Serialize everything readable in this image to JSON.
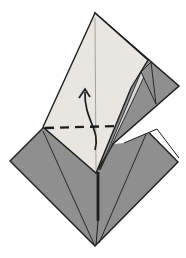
{
  "figure": {
    "diagram_type": "origami-fold-step",
    "canvas": {
      "width": 186,
      "height": 258,
      "background": "#ffffff"
    },
    "colors": {
      "light": "#e7e6e1",
      "dark": "#8f8f8f",
      "sliver": "#d8d7d2",
      "outline": "#1d1d1d",
      "white": "#ffffff",
      "crease": "#9b9a95"
    },
    "shapes": [
      {
        "name": "base-diamond",
        "kind": "polygon",
        "points": "10,161 94,77 178,162 95,246",
        "fill": "dark",
        "stroke": "outline",
        "sw": 1.4
      },
      {
        "name": "diamond-crease-left",
        "kind": "line",
        "x1": 43,
        "y1": 131,
        "x2": 94,
        "y2": 244,
        "stroke": "outline",
        "sw": 0.9
      },
      {
        "name": "diamond-crease-right",
        "kind": "line",
        "x1": 147,
        "y1": 132,
        "x2": 99,
        "y2": 243,
        "stroke": "outline",
        "sw": 0.9
      },
      {
        "name": "background-gap",
        "kind": "polygon",
        "points": "113,144 179,87 179,158 157,129 124,143",
        "fill": "white",
        "sw": 0
      },
      {
        "name": "gap-lower-edge",
        "kind": "path",
        "d": "M 124,143 L 157,129 L 179,158",
        "fill": "none",
        "stroke": "outline",
        "sw": 1
      },
      {
        "name": "right-flap",
        "kind": "polygon",
        "points": "95,13 179,86 113,144 99,168",
        "fill": "dark",
        "stroke": "outline",
        "sw": 1.5
      },
      {
        "name": "flap-edge-highlight",
        "kind": "polygon",
        "points": "100,170 141,72 151,62",
        "fill": "sliver",
        "stroke": "outline",
        "sw": 0.9
      },
      {
        "name": "flap-fold-triangle",
        "kind": "polygon",
        "points": "151,62 141,72 156,104",
        "fill": "dark",
        "stroke": "outline",
        "sw": 0.9
      },
      {
        "name": "front-kite",
        "kind": "polygon",
        "points": "95,13 43,127 96,173 131,88 148,60",
        "fill": "light",
        "stroke": "outline",
        "sw": 1.4
      },
      {
        "name": "kite-center-crease",
        "kind": "line",
        "x1": 95,
        "y1": 18,
        "x2": 96,
        "y2": 170,
        "stroke": "crease",
        "sw": 0.9
      },
      {
        "name": "valley-fold-dashed-line",
        "kind": "line",
        "x1": 45,
        "y1": 128,
        "x2": 117,
        "y2": 126,
        "stroke": "outline",
        "sw": 2.4,
        "dash": "9,6"
      },
      {
        "name": "center-thick-edge",
        "kind": "line",
        "x1": 98,
        "y1": 172,
        "x2": 98,
        "y2": 221,
        "stroke": "outline",
        "sw": 2.8
      },
      {
        "name": "center-thin-edge",
        "kind": "line",
        "x1": 98,
        "y1": 221,
        "x2": 96,
        "y2": 245,
        "stroke": "outline",
        "sw": 1
      },
      {
        "name": "fold-arrow-curve",
        "kind": "path",
        "d": "M 95,150 C 101,130 84,120 85,92",
        "fill": "none",
        "stroke": "outline",
        "sw": 1.7
      },
      {
        "name": "fold-arrow-head",
        "kind": "path",
        "d": "M 79,98 L 85,89 L 90,97",
        "fill": "none",
        "stroke": "outline",
        "sw": 1.7
      }
    ]
  }
}
